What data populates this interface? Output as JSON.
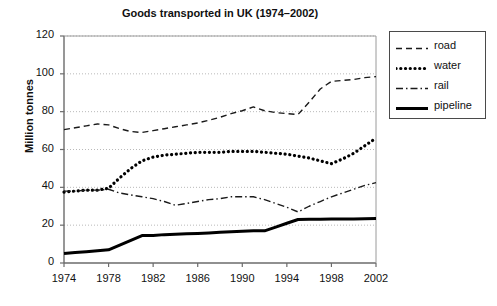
{
  "chart_data": {
    "type": "line",
    "title": "Goods transported in UK (1974–2002)",
    "xlabel": "",
    "ylabel": "Million tonnes",
    "xlim": [
      1974,
      2002
    ],
    "ylim": [
      0,
      120
    ],
    "ytick_step": 20,
    "xtick_step": 4,
    "grid": true,
    "grid_axis": "y",
    "legend_position": "outside-right-top",
    "yticks": [
      0,
      20,
      40,
      60,
      80,
      100,
      120
    ],
    "ytick_labels": [
      "0",
      "20",
      "40",
      "60",
      "80",
      "100",
      "120"
    ],
    "xticks": [
      1974,
      1978,
      1982,
      1986,
      1990,
      1994,
      1998,
      2002
    ],
    "xtick_labels": [
      "1974",
      "1978",
      "1982",
      "1986",
      "1990",
      "1994",
      "1998",
      "2002"
    ],
    "x": [
      1974,
      1975,
      1976,
      1977,
      1978,
      1979,
      1980,
      1981,
      1982,
      1983,
      1984,
      1985,
      1986,
      1987,
      1988,
      1989,
      1990,
      1991,
      1992,
      1993,
      1994,
      1995,
      1996,
      1997,
      1998,
      1999,
      2000,
      2001,
      2002
    ],
    "series": [
      {
        "name": "road",
        "style": "dashed",
        "color": "#1a1a1a",
        "width": 1.4,
        "values": [
          70.5,
          71.5,
          72.5,
          73.5,
          73.0,
          71.0,
          69.5,
          69.0,
          70.0,
          71.0,
          72.0,
          73.0,
          74.0,
          75.5,
          77.0,
          79.0,
          80.5,
          82.5,
          80.5,
          79.5,
          79.0,
          78.5,
          85.0,
          92.0,
          96.0,
          96.5,
          97.0,
          98.0,
          98.5
        ]
      },
      {
        "name": "water",
        "style": "dotted",
        "color": "#000000",
        "width": 3.2,
        "values": [
          37.5,
          38.0,
          38.5,
          38.5,
          39.5,
          45.0,
          50.0,
          54.0,
          56.0,
          57.0,
          57.5,
          58.0,
          58.5,
          58.5,
          58.5,
          59.0,
          59.0,
          59.0,
          58.5,
          58.0,
          57.5,
          56.5,
          55.5,
          54.0,
          52.5,
          55.0,
          58.0,
          62.0,
          66.0
        ]
      },
      {
        "name": "rail",
        "style": "dashdot",
        "color": "#1a1a1a",
        "width": 1.4,
        "values": [
          38.0,
          38.0,
          38.5,
          38.5,
          39.0,
          37.0,
          36.0,
          35.0,
          34.0,
          32.5,
          30.5,
          31.5,
          32.5,
          33.5,
          34.0,
          35.0,
          35.0,
          35.0,
          33.5,
          31.5,
          29.5,
          27.0,
          30.0,
          32.5,
          35.0,
          37.0,
          39.0,
          41.0,
          42.5
        ]
      },
      {
        "name": "pipeline",
        "style": "solid",
        "color": "#000000",
        "width": 3.0,
        "values": [
          5.0,
          5.5,
          6.0,
          6.5,
          7.0,
          9.5,
          12.0,
          14.5,
          14.5,
          15.0,
          15.2,
          15.4,
          15.6,
          15.9,
          16.2,
          16.5,
          16.8,
          17.0,
          17.0,
          19.0,
          21.0,
          23.0,
          23.1,
          23.1,
          23.2,
          23.2,
          23.3,
          23.4,
          23.5
        ]
      }
    ],
    "legend_entries": [
      {
        "label": "road",
        "style": "dashed"
      },
      {
        "label": "water",
        "style": "dotted"
      },
      {
        "label": "rail",
        "style": "dashdot"
      },
      {
        "label": "pipeline",
        "style": "solid"
      }
    ]
  }
}
